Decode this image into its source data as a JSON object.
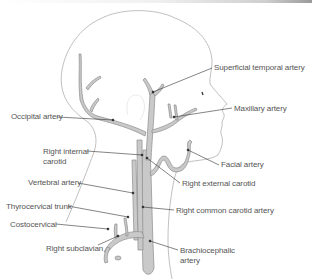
{
  "diagram": {
    "colors": {
      "outline": "#a8a8a8",
      "artery_fill": "#c8c8c8",
      "artery_stroke": "#8c8c8c",
      "leader": "#333333",
      "label_text": "#555555"
    },
    "labels": {
      "superficial_temporal": "Superficial temporal artery",
      "maxillary": "Maxillary artery",
      "occipital": "Occipital artery",
      "right_internal_carotid_1": "Right internal",
      "right_internal_carotid_2": "carotid",
      "facial": "Facial artery",
      "vertebral": "Vertebral artery",
      "right_external_carotid": "Right external carotid",
      "thyrocervical": "Thyrocervical trunk",
      "right_common_carotid": "Right common carotid artery",
      "costocervical": "Costocervical",
      "right_subclavian": "Right subclavian",
      "brachiocephalic_1": "Brachiocephalic",
      "brachiocephalic_2": "artery"
    }
  }
}
